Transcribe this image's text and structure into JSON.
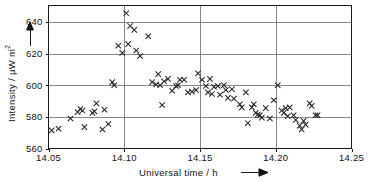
{
  "figure": {
    "background_color": "#ffffff",
    "frame_color": "#1a1a1a",
    "grid_color": "#555555",
    "marker_color": "#262626"
  },
  "axes": {
    "x_title": "Universal time / h",
    "x_title_arrow": "⟶",
    "y_title_main": "Intensity / µW m",
    "y_title_exponent": "-2",
    "y_arrow": "↑"
  },
  "chart_data": {
    "type": "scatter",
    "title": "",
    "xlabel": "Universal time / h",
    "ylabel": "Intensity / µW m-2",
    "xlim": [
      14.05,
      14.25
    ],
    "ylim": [
      560,
      648
    ],
    "xticks": [
      "14.05",
      "14.10",
      "14.15",
      "14.20",
      "14.25"
    ],
    "xtick_values": [
      14.05,
      14.1,
      14.15,
      14.2,
      14.25
    ],
    "yticks": [
      "560",
      "580",
      "600",
      "620",
      "640"
    ],
    "ytick_values": [
      560,
      580,
      600,
      620,
      640
    ],
    "grid": true,
    "grid_axes": "both",
    "legend": false,
    "marker": "x",
    "marker_size": 4.2,
    "series": [
      {
        "name": "Solar radio burst intensity",
        "points": [
          [
            14.0521,
            571.5
          ],
          [
            14.0566,
            572.5
          ],
          [
            14.0645,
            579.0
          ],
          [
            14.0692,
            583.0
          ],
          [
            14.0711,
            585.0
          ],
          [
            14.0724,
            584.0
          ],
          [
            14.0737,
            573.5
          ],
          [
            14.079,
            582.5
          ],
          [
            14.0803,
            583.5
          ],
          [
            14.0816,
            588.5
          ],
          [
            14.0856,
            572.0
          ],
          [
            14.0869,
            584.5
          ],
          [
            14.0895,
            575.5
          ],
          [
            14.0921,
            602.0
          ],
          [
            14.0934,
            600.0
          ],
          [
            14.0961,
            625.0
          ],
          [
            14.0987,
            620.5
          ],
          [
            14.1013,
            645.5
          ],
          [
            14.1026,
            626.0
          ],
          [
            14.1039,
            637.5
          ],
          [
            14.1066,
            635.0
          ],
          [
            14.1079,
            622.0
          ],
          [
            14.1105,
            618.5
          ],
          [
            14.1158,
            631.0
          ],
          [
            14.1184,
            602.0
          ],
          [
            14.1211,
            600.5
          ],
          [
            14.1224,
            607.0
          ],
          [
            14.1237,
            600.0
          ],
          [
            14.125,
            587.5
          ],
          [
            14.1263,
            602.5
          ],
          [
            14.1289,
            604.0
          ],
          [
            14.1316,
            596.5
          ],
          [
            14.1342,
            599.5
          ],
          [
            14.1355,
            600.0
          ],
          [
            14.1368,
            603.5
          ],
          [
            14.1395,
            603.5
          ],
          [
            14.1421,
            595.5
          ],
          [
            14.1447,
            596.0
          ],
          [
            14.1474,
            597.0
          ],
          [
            14.1487,
            607.5
          ],
          [
            14.1513,
            603.5
          ],
          [
            14.1539,
            599.5
          ],
          [
            14.1553,
            595.5
          ],
          [
            14.1566,
            604.0
          ],
          [
            14.1579,
            594.5
          ],
          [
            14.1592,
            599.0
          ],
          [
            14.1618,
            599.5
          ],
          [
            14.1632,
            594.0
          ],
          [
            14.1658,
            600.0
          ],
          [
            14.1671,
            597.0
          ],
          [
            14.1684,
            592.0
          ],
          [
            14.1711,
            597.5
          ],
          [
            14.1724,
            591.5
          ],
          [
            14.1763,
            588.0
          ],
          [
            14.1776,
            586.0
          ],
          [
            14.1803,
            595.5
          ],
          [
            14.1816,
            576.0
          ],
          [
            14.1842,
            586.0
          ],
          [
            14.1855,
            588.0
          ],
          [
            14.1868,
            582.5
          ],
          [
            14.1882,
            581.5
          ],
          [
            14.1895,
            581.0
          ],
          [
            14.1908,
            579.5
          ],
          [
            14.1934,
            585.5
          ],
          [
            14.1961,
            579.0
          ],
          [
            14.1987,
            590.5
          ],
          [
            14.2013,
            600.0
          ],
          [
            14.2039,
            584.0
          ],
          [
            14.2053,
            582.5
          ],
          [
            14.2066,
            585.5
          ],
          [
            14.2079,
            580.5
          ],
          [
            14.2092,
            586.0
          ],
          [
            14.2118,
            581.0
          ],
          [
            14.2132,
            578.0
          ],
          [
            14.2158,
            574.5
          ],
          [
            14.2171,
            572.0
          ],
          [
            14.2184,
            577.5
          ],
          [
            14.2197,
            575.0
          ],
          [
            14.2224,
            588.5
          ],
          [
            14.2237,
            587.0
          ],
          [
            14.2263,
            581.0
          ],
          [
            14.2276,
            581.0
          ]
        ]
      }
    ]
  }
}
